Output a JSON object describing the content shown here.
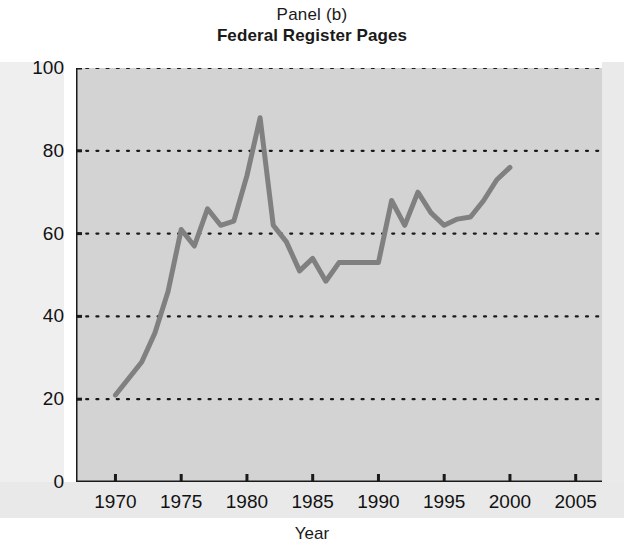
{
  "figure": {
    "title_panel": "Panel (b)",
    "title_main": "Federal Register Pages",
    "xlabel": "Year",
    "ylabel": "Thousands",
    "line_color": "#808080",
    "plot_background": "#d3d3d3",
    "axis_color": "#1a1a1a"
  },
  "chart_data": {
    "type": "line",
    "title": "Federal Register Pages",
    "subtitle": "Panel (b)",
    "xlabel": "Year",
    "ylabel": "Thousands",
    "xlim": [
      1967,
      2007
    ],
    "ylim": [
      0,
      100
    ],
    "grid": true,
    "grid_style": "dotted-horizontal",
    "legend": null,
    "xticks": [
      1970,
      1975,
      1980,
      1985,
      1990,
      1995,
      2000,
      2005
    ],
    "xtick_labels": [
      "1970",
      "1975",
      "1980",
      "1985",
      "1990",
      "1995",
      "2000",
      "2005"
    ],
    "yticks": [
      0,
      20,
      40,
      60,
      80,
      100
    ],
    "ytick_labels": [
      "0",
      "20",
      "40",
      "60",
      "80",
      "100"
    ],
    "x": [
      1970,
      1971,
      1972,
      1973,
      1974,
      1975,
      1976,
      1977,
      1978,
      1979,
      1980,
      1981,
      1982,
      1983,
      1984,
      1985,
      1986,
      1987,
      1988,
      1989,
      1990,
      1991,
      1992,
      1993,
      1994,
      1995,
      1996,
      1997,
      1998,
      1999,
      2000
    ],
    "values": [
      21,
      25,
      29,
      36,
      46,
      61,
      57,
      66,
      62,
      63,
      74,
      88,
      62,
      58,
      51,
      54,
      48.5,
      53,
      53,
      53,
      53,
      68,
      62,
      70,
      65,
      62,
      63.5,
      64,
      68,
      73,
      76
    ],
    "series": [
      {
        "name": "Federal Register Pages",
        "color": "#808080",
        "x": [
          1970,
          1971,
          1972,
          1973,
          1974,
          1975,
          1976,
          1977,
          1978,
          1979,
          1980,
          1981,
          1982,
          1983,
          1984,
          1985,
          1986,
          1987,
          1988,
          1989,
          1990,
          1991,
          1992,
          1993,
          1994,
          1995,
          1996,
          1997,
          1998,
          1999,
          2000
        ],
        "values": [
          21,
          25,
          29,
          36,
          46,
          61,
          57,
          66,
          62,
          63,
          74,
          88,
          62,
          58,
          51,
          54,
          48.5,
          53,
          53,
          53,
          53,
          68,
          62,
          70,
          65,
          62,
          63.5,
          64,
          68,
          73,
          76
        ]
      }
    ]
  }
}
